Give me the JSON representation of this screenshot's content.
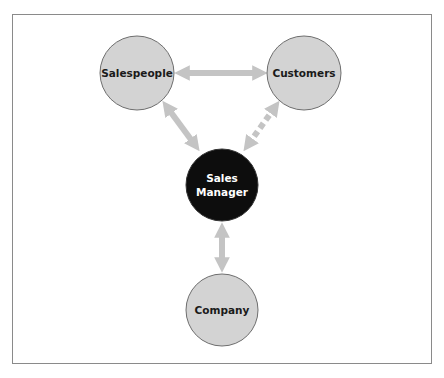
{
  "diagram": {
    "nodes": [
      {
        "id": "salespeople",
        "label": "Salespeople",
        "cx": 137,
        "cy": 73,
        "r": 37,
        "fill": "#d3d3d3",
        "text_color": "#1a1a1a"
      },
      {
        "id": "customers",
        "label": "Customers",
        "cx": 304,
        "cy": 73,
        "r": 37,
        "fill": "#d3d3d3",
        "text_color": "#1a1a1a"
      },
      {
        "id": "sales-manager",
        "label_line1": "Sales",
        "label_line2": "Manager",
        "cx": 222,
        "cy": 185,
        "r": 36,
        "fill": "#0d0d0d",
        "text_color": "#ffffff"
      },
      {
        "id": "company",
        "label": "Company",
        "cx": 222,
        "cy": 310,
        "r": 36,
        "fill": "#d3d3d3",
        "text_color": "#1a1a1a"
      }
    ],
    "edges": [
      {
        "from": "salespeople",
        "to": "customers",
        "style": "solid",
        "direction": "bidirectional"
      },
      {
        "from": "salespeople",
        "to": "sales-manager",
        "style": "solid",
        "direction": "bidirectional"
      },
      {
        "from": "customers",
        "to": "sales-manager",
        "style": "dashed",
        "direction": "bidirectional"
      },
      {
        "from": "sales-manager",
        "to": "company",
        "style": "solid",
        "direction": "bidirectional"
      }
    ],
    "arrow_color": "#c4c4c4",
    "frame_color": "#8a8a8a"
  }
}
